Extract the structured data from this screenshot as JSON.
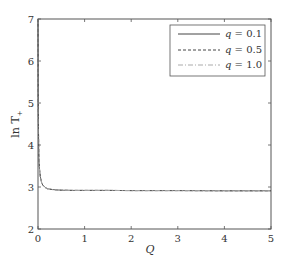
{
  "chart_data": {
    "type": "line",
    "title": "",
    "xlabel": "Q",
    "ylabel": "ln T+",
    "xlim": [
      0,
      5
    ],
    "ylim": [
      2,
      7
    ],
    "xticks": [
      0,
      1,
      2,
      3,
      4,
      5
    ],
    "yticks": [
      2,
      3,
      4,
      5,
      6,
      7
    ],
    "grid": false,
    "legend_position": "upper right",
    "x": [
      0.0,
      0.005,
      0.01,
      0.02,
      0.03,
      0.05,
      0.08,
      0.1,
      0.15,
      0.2,
      0.3,
      0.4,
      0.5,
      0.75,
      1.0,
      1.5,
      2.0,
      3.0,
      4.0,
      5.0
    ],
    "series": [
      {
        "name": "q = 0.1",
        "style": "solid",
        "values": [
          7.0,
          5.2,
          4.3,
          3.7,
          3.45,
          3.25,
          3.1,
          3.05,
          2.99,
          2.96,
          2.94,
          2.93,
          2.925,
          2.92,
          2.92,
          2.92,
          2.915,
          2.915,
          2.91,
          2.91
        ]
      },
      {
        "name": "q = 0.5",
        "style": "dashed",
        "values": [
          7.0,
          5.2,
          4.3,
          3.7,
          3.45,
          3.25,
          3.1,
          3.05,
          2.99,
          2.96,
          2.94,
          2.93,
          2.925,
          2.92,
          2.92,
          2.92,
          2.915,
          2.915,
          2.91,
          2.91
        ]
      },
      {
        "name": "q = 1.0",
        "style": "dashdot",
        "values": [
          7.0,
          5.2,
          4.3,
          3.7,
          3.45,
          3.25,
          3.1,
          3.05,
          2.99,
          2.96,
          2.94,
          2.93,
          2.925,
          2.92,
          2.92,
          2.92,
          2.915,
          2.915,
          2.91,
          2.91
        ]
      }
    ]
  },
  "labels": {
    "xlabel": "Q",
    "ylabel_main": "ln T",
    "ylabel_sub": "+",
    "legend": [
      {
        "q": "q",
        "eq": " = 0.1"
      },
      {
        "q": "q",
        "eq": " = 0.5"
      },
      {
        "q": "q",
        "eq": " = 1.0"
      }
    ]
  }
}
